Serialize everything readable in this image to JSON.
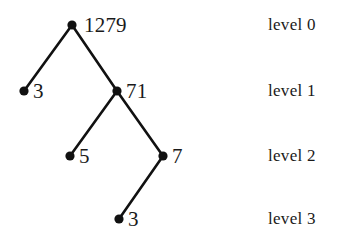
{
  "figure": {
    "background_color": "#ffffff",
    "ink_color": "#111111",
    "caption": ""
  },
  "tree": {
    "node_radius": 4.6,
    "edge_width": 2.6,
    "nodes": [
      {
        "id": "root",
        "value": "1279",
        "level": 0,
        "x": 72,
        "y": 25,
        "label_x": 84,
        "label_y": 15
      },
      {
        "id": "n3a",
        "value": "3",
        "level": 1,
        "x": 24,
        "y": 91,
        "label_x": 33,
        "label_y": 81
      },
      {
        "id": "n71",
        "value": "71",
        "level": 1,
        "x": 117,
        "y": 91,
        "label_x": 126,
        "label_y": 81
      },
      {
        "id": "n5",
        "value": "5",
        "level": 2,
        "x": 70,
        "y": 156,
        "label_x": 79,
        "label_y": 146
      },
      {
        "id": "n7",
        "value": "7",
        "level": 2,
        "x": 163,
        "y": 156,
        "label_x": 172,
        "label_y": 146
      },
      {
        "id": "n3b",
        "value": "3",
        "level": 3,
        "x": 119,
        "y": 219,
        "label_x": 128,
        "label_y": 209
      }
    ],
    "edges": [
      {
        "from": "root",
        "to": "n3a",
        "x1": 72,
        "y1": 25,
        "x2": 24,
        "y2": 91
      },
      {
        "from": "root",
        "to": "n71",
        "x1": 72,
        "y1": 25,
        "x2": 117,
        "y2": 91
      },
      {
        "from": "n71",
        "to": "n5",
        "x1": 117,
        "y1": 91,
        "x2": 70,
        "y2": 156
      },
      {
        "from": "n71",
        "to": "n7",
        "x1": 117,
        "y1": 91,
        "x2": 163,
        "y2": 156
      },
      {
        "from": "n7",
        "to": "n3b",
        "x1": 163,
        "y1": 156,
        "x2": 119,
        "y2": 219
      }
    ]
  },
  "levels": [
    {
      "label": "level 0",
      "x": 268,
      "y": 16
    },
    {
      "label": "level 1",
      "x": 268,
      "y": 82
    },
    {
      "label": "level 2",
      "x": 268,
      "y": 147
    },
    {
      "label": "level 3",
      "x": 268,
      "y": 210
    }
  ],
  "chart_data": {
    "type": "diagram",
    "title": "",
    "nodes": [
      "1279",
      "3",
      "71",
      "5",
      "7",
      "3"
    ],
    "levels": [
      0,
      1,
      1,
      2,
      2,
      3
    ],
    "edges": [
      [
        "1279",
        "3"
      ],
      [
        "1279",
        "71"
      ],
      [
        "71",
        "5"
      ],
      [
        "71",
        "7"
      ],
      [
        "7",
        "3"
      ]
    ],
    "level_labels": [
      "level 0",
      "level 1",
      "level 2",
      "level 3"
    ]
  }
}
